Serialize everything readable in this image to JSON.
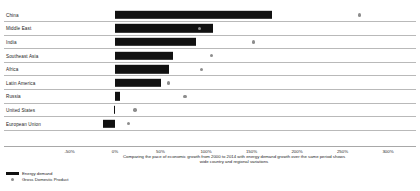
{
  "chart_data": {
    "type": "bar",
    "title": "",
    "subtitle": "",
    "xlabel": "",
    "ylabel": "",
    "xlim": [
      -50,
      300
    ],
    "grid": false,
    "orientation": "horizontal",
    "legend_position": "bottom-left",
    "tick_labels": [
      "-50%",
      "0%",
      "50%",
      "100%",
      "150%",
      "200%",
      "250%",
      "300%"
    ],
    "ticks": [
      -50,
      0,
      50,
      100,
      150,
      200,
      250,
      300
    ],
    "categories": [
      "China",
      "Middle East",
      "India",
      "Southeast Asia",
      "Africa",
      "Latin America",
      "Russia",
      "United States",
      "European Union"
    ],
    "series": [
      {
        "name": "Energy demand",
        "type": "bar",
        "color": "#111111",
        "values": [
          172,
          108,
          89,
          64,
          59,
          51,
          6,
          -1,
          -13
        ]
      },
      {
        "name": "Gross Domestic Product",
        "type": "scatter",
        "color": "#8d8d8d",
        "values": [
          269,
          93,
          152,
          106,
          95,
          59,
          77,
          22,
          15
        ]
      }
    ],
    "caption": "Comparing the pace of economic growth from 2000 to 2014 with energy demand growth over the same period shows wide country and regional variations",
    "legend": [
      {
        "label": "Energy demand",
        "marker": "bar",
        "color": "#111111"
      },
      {
        "label": "Gross Domestic Product",
        "marker": "dot",
        "color": "#8d8d8d"
      }
    ]
  }
}
